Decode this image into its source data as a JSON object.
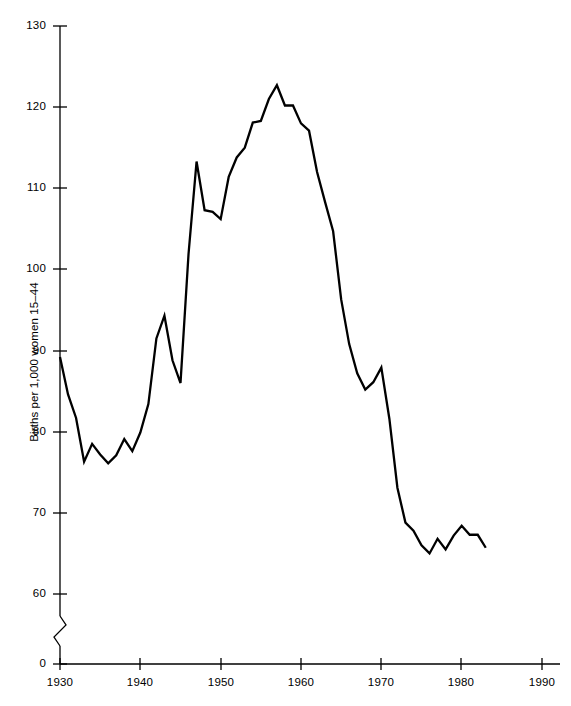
{
  "chart_data": {
    "type": "line",
    "title": "",
    "subtitle": "",
    "xlabel": "",
    "ylabel": "Births per 1,000 women 15–44",
    "grid": false,
    "legend": "none",
    "axis_break": true,
    "axis_break_note": "y-axis broken between 0 and 60",
    "xlim": [
      1930,
      1990
    ],
    "ylim": [
      60,
      130
    ],
    "xticks": [
      "1930",
      "1940",
      "1950",
      "1960",
      "1970",
      "1980",
      "1990"
    ],
    "yticks": [
      "0",
      "60",
      "70",
      "80",
      "90",
      "100",
      "110",
      "120",
      "130"
    ],
    "series": [
      {
        "name": "General fertility rate",
        "color": "#000000",
        "x": [
          1930,
          1931,
          1932,
          1933,
          1934,
          1935,
          1936,
          1937,
          1938,
          1939,
          1940,
          1941,
          1942,
          1943,
          1944,
          1945,
          1946,
          1947,
          1948,
          1949,
          1950,
          1951,
          1952,
          1953,
          1954,
          1955,
          1956,
          1957,
          1958,
          1959,
          1960,
          1961,
          1962,
          1963,
          1964,
          1965,
          1966,
          1967,
          1968,
          1969,
          1970,
          1971,
          1972,
          1973,
          1974,
          1975,
          1976,
          1977,
          1978,
          1979,
          1980,
          1981,
          1982,
          1983
        ],
        "values": [
          89.2,
          84.6,
          81.7,
          76.3,
          78.5,
          77.2,
          76.1,
          77.1,
          79.1,
          77.6,
          79.9,
          83.4,
          91.5,
          94.3,
          88.8,
          86.0,
          101.9,
          113.3,
          107.3,
          107.1,
          106.2,
          111.4,
          113.8,
          115.0,
          118.1,
          118.3,
          121.0,
          122.7,
          120.2,
          120.2,
          118.0,
          117.1,
          112.0,
          108.3,
          104.7,
          96.3,
          90.8,
          87.2,
          85.2,
          86.1,
          87.9,
          81.6,
          73.1,
          68.8,
          67.8,
          66.0,
          65.0,
          66.8,
          65.5,
          67.2,
          68.4,
          67.3,
          67.3,
          65.7
        ],
        "annotations": [
          {
            "label": "baby-boom peak",
            "x": 1957,
            "y": 122.7
          },
          {
            "label": "post-war spike",
            "x": 1947,
            "y": 113.3
          },
          {
            "label": "depression low",
            "x": 1933,
            "y": 76.3
          },
          {
            "label": "series end",
            "x": 1983,
            "y": 65.7
          }
        ]
      }
    ]
  }
}
